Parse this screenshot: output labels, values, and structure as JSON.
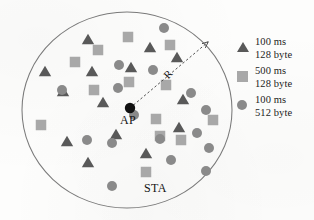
{
  "figure": {
    "type": "network-topology-diagram",
    "labels": {
      "ap": "AP",
      "sta": "STA",
      "radius": "R"
    }
  },
  "colors": {
    "triangle": "#595959",
    "square": "#a8a8a8",
    "circle": "#8a8a8a",
    "ap_dot": "#111111",
    "cell_outline": "#7a7a7a",
    "arrow": "#4a4a4a",
    "text": "#131313",
    "background": "#fdfdfc"
  },
  "cell": {
    "cx": 127,
    "cy": 110,
    "rx": 105,
    "ry": 98
  },
  "ap": {
    "x": 130,
    "y": 108,
    "r": 5.2
  },
  "radius_arrow": {
    "from_x": 130,
    "from_y": 108,
    "to_x": 208,
    "to_y": 42,
    "label": "R"
  },
  "legend": {
    "title": "",
    "entries": [
      {
        "glyph": "triangle-icon",
        "line1": "100 ms",
        "line2": "128 byte"
      },
      {
        "glyph": "square-icon",
        "line1": "500 ms",
        "line2": "128 byte"
      },
      {
        "glyph": "circle-icon",
        "line1": "100 ms",
        "line2": "512 byte"
      }
    ]
  },
  "chart_data": {
    "type": "scatter",
    "title": "",
    "xlabel": "",
    "ylabel": "",
    "legend_position": "right",
    "grid": false,
    "series": [
      {
        "name": "100 ms / 128 byte",
        "marker": "triangle",
        "color": "#595959",
        "points": [
          [
            88,
            40
          ],
          [
            45,
            72
          ],
          [
            92,
            72
          ],
          [
            150,
            48
          ],
          [
            131,
            68
          ],
          [
            177,
            58
          ],
          [
            63,
            92
          ],
          [
            103,
            103
          ],
          [
            183,
            100
          ],
          [
            67,
            142
          ],
          [
            116,
            135
          ],
          [
            179,
            128
          ],
          [
            146,
            154
          ],
          [
            88,
            163
          ]
        ]
      },
      {
        "name": "500 ms / 128 byte",
        "marker": "square",
        "color": "#a8a8a8",
        "points": [
          [
            128,
            37
          ],
          [
            170,
            45
          ],
          [
            98,
            50
          ],
          [
            75,
            62
          ],
          [
            129,
            82
          ],
          [
            166,
            85
          ],
          [
            94,
            90
          ],
          [
            156,
            119
          ],
          [
            213,
            120
          ],
          [
            41,
            125
          ],
          [
            146,
            172
          ],
          [
            181,
            140
          ],
          [
            160,
            136
          ]
        ]
      },
      {
        "name": "100 ms / 512 byte",
        "marker": "circle",
        "color": "#8a8a8a",
        "points": [
          [
            164,
            28
          ],
          [
            119,
            65
          ],
          [
            153,
            70
          ],
          [
            62,
            90
          ],
          [
            118,
            88
          ],
          [
            191,
            93
          ],
          [
            206,
            110
          ],
          [
            134,
            115
          ],
          [
            87,
            140
          ],
          [
            112,
            143
          ],
          [
            160,
            139
          ],
          [
            197,
            133
          ],
          [
            209,
            148
          ],
          [
            171,
            160
          ],
          [
            206,
            171
          ],
          [
            112,
            186
          ]
        ]
      }
    ]
  }
}
